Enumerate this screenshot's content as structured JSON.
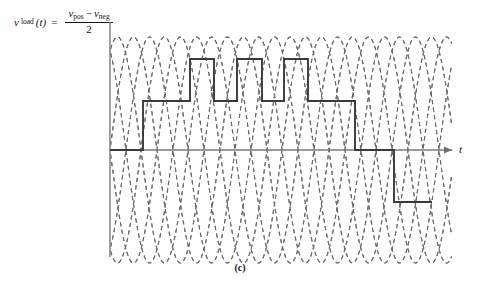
{
  "figure": {
    "caption": "(c)",
    "formula": {
      "lhs_v": "v",
      "lhs_sub": "load",
      "lhs_arg": "(t)",
      "equals": "=",
      "num_v1": "v",
      "num_sub1": "pos",
      "num_minus": "−",
      "num_v2": "v",
      "num_sub2": "neg",
      "denominator": "2"
    },
    "axis": {
      "x_label": "t",
      "y_label": ""
    },
    "colors": {
      "waveform": "#3a3a3a",
      "carrier": "#5a5a5a",
      "axis": "#6e6e6e",
      "background": "#ffffff"
    }
  },
  "chart_data": {
    "type": "line",
    "title": "",
    "subtitle": "",
    "xlabel": "t",
    "ylabel": "",
    "grid": false,
    "legend": null,
    "annotations": [
      "(c)"
    ],
    "axis_ranges": {
      "x_pixels": [
        110,
        452
      ],
      "y_levels_pixels": {
        "plus2": 59,
        "plus1": 101,
        "zero": 150,
        "minus1": 202
      },
      "ylim_levels": [
        -2,
        2
      ],
      "carrier_peak_px": 36,
      "carrier_trough_px": 262
    },
    "x_ticks_px": [
      157,
      204,
      251,
      298,
      345,
      392,
      439
    ],
    "series": [
      {
        "name": "v_load staircase",
        "style": "solid",
        "points_px": [
          [
            110,
            150
          ],
          [
            143,
            150
          ],
          [
            143,
            101
          ],
          [
            190,
            101
          ],
          [
            190,
            59
          ],
          [
            214,
            59
          ],
          [
            214,
            101
          ],
          [
            237,
            101
          ],
          [
            237,
            59
          ],
          [
            262,
            59
          ],
          [
            262,
            101
          ],
          [
            284,
            101
          ],
          [
            284,
            59
          ],
          [
            308,
            59
          ],
          [
            308,
            101
          ],
          [
            355,
            101
          ],
          [
            355,
            150
          ],
          [
            394,
            150
          ],
          [
            394,
            202
          ],
          [
            432,
            202
          ]
        ],
        "levels_sequence": [
          0,
          1,
          2,
          1,
          2,
          1,
          2,
          1,
          0,
          -1
        ]
      },
      {
        "name": "phase-shifted sinusoidal carriers",
        "style": "dashed",
        "count": 6,
        "period_px": 94,
        "amplitude_px": 113,
        "phase_offsets_px": [
          0,
          16,
          31,
          47,
          63,
          78
        ]
      }
    ]
  }
}
